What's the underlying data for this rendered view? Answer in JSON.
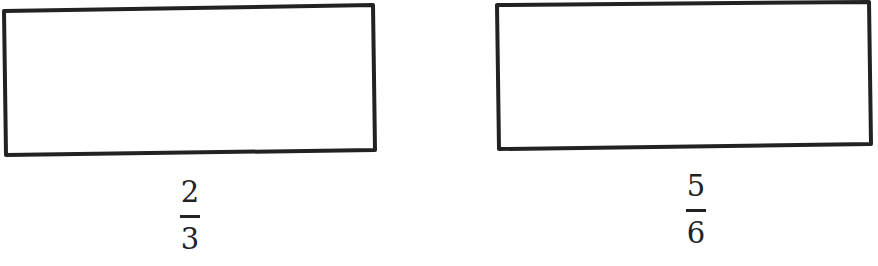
{
  "figure": {
    "rectangles": [
      {
        "id": "left",
        "label": {
          "numerator": "2",
          "denominator": "3"
        }
      },
      {
        "id": "right",
        "label": {
          "numerator": "5",
          "denominator": "6"
        }
      }
    ],
    "colors": {
      "stroke": "#222222",
      "background": "#ffffff"
    }
  }
}
